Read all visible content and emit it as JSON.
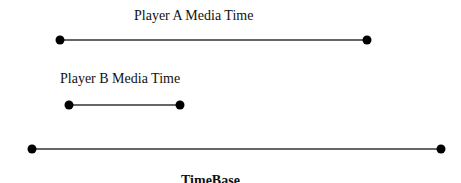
{
  "diagram": {
    "lines": [
      {
        "id": "player-a",
        "label": "Player A Media Time",
        "x1": 60,
        "x2": 367,
        "y": 40
      },
      {
        "id": "player-b",
        "label": "Player B Media Time",
        "x1": 69,
        "x2": 180,
        "y": 105
      },
      {
        "id": "timebase",
        "label": "TimeBase",
        "x1": 32,
        "x2": 441,
        "y": 149
      }
    ],
    "colors": {
      "line": "#333333",
      "dot": "#000000",
      "text": "#111111"
    }
  }
}
